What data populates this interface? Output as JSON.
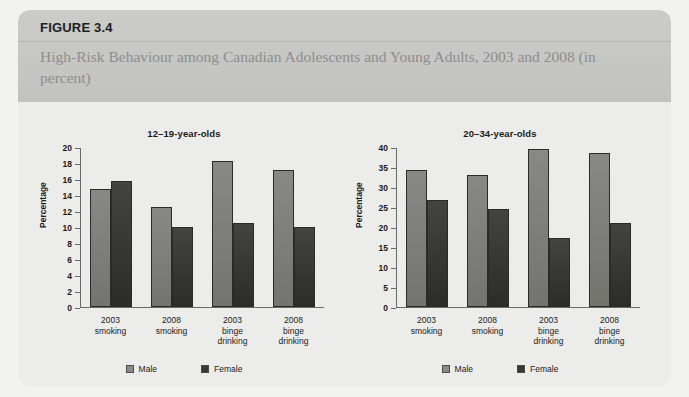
{
  "figure": {
    "number_label": "FIGURE 3.4",
    "subtitle": "High-Risk Behaviour among Canadian Adolescents and Young Adults, 2003 and 2008 (in percent)"
  },
  "legend": {
    "male_label": "Male",
    "female_label": "Female",
    "male_color": "#7a7a78",
    "female_color": "#353533"
  },
  "chart_data": [
    {
      "type": "bar",
      "title": "12–19-year-olds",
      "xlabel": "",
      "ylabel": "Percentage",
      "ylim": [
        0,
        20
      ],
      "yticks": [
        0,
        2,
        4,
        6,
        8,
        10,
        12,
        14,
        16,
        18,
        20
      ],
      "ytick_labels": [
        "0",
        "2",
        "4",
        "6",
        "8",
        "10",
        "12",
        "14",
        "16",
        "18",
        "20"
      ],
      "grid": false,
      "legend_position": "bottom-center",
      "categories": [
        "2003\nsmoking",
        "2008\nsmoking",
        "2003\nbinge\ndrinking",
        "2008\nbinge\ndrinking"
      ],
      "series": [
        {
          "name": "Male",
          "color": "#7a7a78",
          "values": [
            14.7,
            12.5,
            18.2,
            17.1
          ]
        },
        {
          "name": "Female",
          "color": "#353533",
          "values": [
            15.8,
            10.0,
            10.5,
            10.0
          ]
        }
      ]
    },
    {
      "type": "bar",
      "title": "20–34-year-olds",
      "xlabel": "",
      "ylabel": "Percentage",
      "ylim": [
        0,
        40
      ],
      "yticks": [
        0,
        5,
        10,
        15,
        20,
        25,
        30,
        35,
        40
      ],
      "ytick_labels": [
        "0",
        "5",
        "10",
        "15",
        "20",
        "25",
        "30",
        "35",
        "40"
      ],
      "grid": false,
      "legend_position": "bottom-center",
      "categories": [
        "2003\nsmoking",
        "2008\nsmoking",
        "2003\nbinge\ndrinking",
        "2008\nbinge\ndrinking"
      ],
      "series": [
        {
          "name": "Male",
          "color": "#7a7a78",
          "values": [
            34.2,
            33.1,
            39.5,
            38.5
          ]
        },
        {
          "name": "Female",
          "color": "#353533",
          "values": [
            26.7,
            24.5,
            17.2,
            21.0
          ]
        }
      ]
    }
  ]
}
